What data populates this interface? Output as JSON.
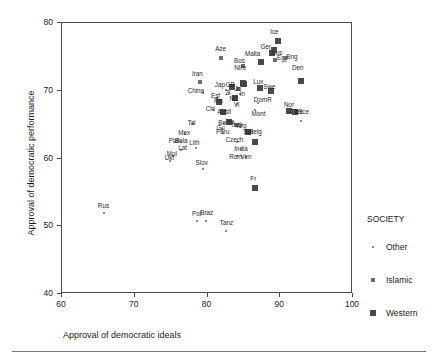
{
  "chart_data": {
    "type": "scatter",
    "title": "",
    "xlabel": "Approval of democratic ideals",
    "ylabel": "Approval of democratic performance",
    "xlim": [
      60,
      100
    ],
    "ylim": [
      40,
      80
    ],
    "xticks": [
      60,
      70,
      80,
      90,
      100
    ],
    "yticks": [
      40,
      50,
      60,
      70,
      80
    ],
    "grid": false,
    "legend": {
      "title": "SOCIETY",
      "position": "right",
      "entries": [
        {
          "label": "Other",
          "marker": "small-dot",
          "color": "#8a8a8a"
        },
        {
          "label": "Islamic",
          "marker": "medium-square",
          "color": "#6e6e6e"
        },
        {
          "label": "Western",
          "marker": "large-square",
          "color": "#4a4a4a"
        }
      ]
    },
    "points": [
      {
        "label": "Ice",
        "x": 89.7,
        "y": 77.4,
        "group": "Western",
        "lx": 89.2,
        "ly": 78.6
      },
      {
        "label": "Ger",
        "x": 89.1,
        "y": 76.0,
        "group": "Western",
        "lx": 88.0,
        "ly": 76.5
      },
      {
        "label": "Aus",
        "x": 88.8,
        "y": 75.5,
        "group": "Western",
        "lx": 89.5,
        "ly": 75.5
      },
      {
        "label": "Malta",
        "x": 87.3,
        "y": 74.3,
        "group": "Western",
        "lx": 86.2,
        "ly": 75.4
      },
      {
        "label": "Egy",
        "x": 89.3,
        "y": 74.5,
        "group": "Islamic",
        "lx": 90.3,
        "ly": 74.8
      },
      {
        "label": "Bng",
        "x": 90.6,
        "y": 74.8,
        "group": "Islamic",
        "lx": 91.6,
        "ly": 75.0
      },
      {
        "label": "Aze",
        "x": 81.9,
        "y": 74.9,
        "group": "Islamic",
        "lx": 81.8,
        "ly": 76.2
      },
      {
        "label": "Bos",
        "x": 84.9,
        "y": 73.6,
        "group": "Islamic",
        "lx": 84.4,
        "ly": 74.4
      },
      {
        "label": "NIre",
        "x": 85.0,
        "y": 71.0,
        "group": "Western",
        "lx": 84.5,
        "ly": 73.4
      },
      {
        "label": "Den",
        "x": 92.8,
        "y": 71.5,
        "group": "Western",
        "lx": 92.4,
        "ly": 73.4
      },
      {
        "label": "Iran",
        "x": 79.0,
        "y": 71.3,
        "group": "Islamic",
        "lx": 78.6,
        "ly": 72.5
      },
      {
        "label": "Lux",
        "x": 87.2,
        "y": 70.4,
        "group": "Western",
        "lx": 87.0,
        "ly": 71.3
      },
      {
        "label": "Swe",
        "x": 88.7,
        "y": 69.9,
        "group": "Western",
        "lx": 88.5,
        "ly": 70.6
      },
      {
        "label": "Jap",
        "x": 82.5,
        "y": 70.1,
        "group": "Other",
        "lx": 81.7,
        "ly": 70.8
      },
      {
        "label": "GB",
        "x": 83.4,
        "y": 70.5,
        "group": "Western",
        "lx": 83.1,
        "ly": 70.8
      },
      {
        "label": "Jo",
        "x": 84.2,
        "y": 70.2,
        "group": "Islamic",
        "lx": 84.2,
        "ly": 70.2
      },
      {
        "label": "Li",
        "x": 84.9,
        "y": 71.1,
        "group": "Western",
        "lx": 84.8,
        "ly": 70.9
      },
      {
        "label": "China",
        "x": 79.4,
        "y": 69.7,
        "group": "Other",
        "lx": 78.4,
        "ly": 69.9
      },
      {
        "label": "Zi",
        "x": 83.0,
        "y": 69.6,
        "group": "Other",
        "lx": 82.8,
        "ly": 69.6
      },
      {
        "label": "In",
        "x": 84.5,
        "y": 69.5,
        "group": "Other",
        "lx": 84.8,
        "ly": 69.5
      },
      {
        "label": "Esf",
        "x": 81.3,
        "y": 69.0,
        "group": "Other",
        "lx": 81.1,
        "ly": 69.2
      },
      {
        "label": "Fin",
        "x": 81.6,
        "y": 68.4,
        "group": "Western",
        "lx": 81.5,
        "ly": 68.5
      },
      {
        "label": "NZ",
        "x": 83.8,
        "y": 68.9,
        "group": "Western",
        "lx": 83.6,
        "ly": 68.8
      },
      {
        "label": "DomR",
        "x": 86.9,
        "y": 68.2,
        "group": "Other",
        "lx": 87.6,
        "ly": 68.7
      },
      {
        "label": "Vi",
        "x": 84.1,
        "y": 68.0,
        "group": "Other",
        "lx": 84.0,
        "ly": 67.9
      },
      {
        "label": "Chi",
        "x": 80.7,
        "y": 67.2,
        "group": "Other",
        "lx": 80.4,
        "ly": 67.3
      },
      {
        "label": "Austl",
        "x": 82.1,
        "y": 66.9,
        "group": "Western",
        "lx": 82.3,
        "ly": 66.8
      },
      {
        "label": "Mont",
        "x": 86.5,
        "y": 67.2,
        "group": "Other",
        "lx": 87.0,
        "ly": 66.5
      },
      {
        "label": "Nor",
        "x": 91.2,
        "y": 67.0,
        "group": "Western",
        "lx": 91.2,
        "ly": 67.9
      },
      {
        "label": "Gre",
        "x": 92.0,
        "y": 66.9,
        "group": "Western",
        "lx": 92.4,
        "ly": 66.9
      },
      {
        "label": "Alb",
        "x": 91.7,
        "y": 66.9,
        "group": "Islamic",
        "lx": 91.9,
        "ly": 66.9
      },
      {
        "label": "Sce",
        "x": 92.9,
        "y": 65.5,
        "group": "Other",
        "lx": 93.2,
        "ly": 66.9
      },
      {
        "label": "Tal",
        "x": 78.0,
        "y": 65.1,
        "group": "Other",
        "lx": 77.8,
        "ly": 65.3
      },
      {
        "label": "Bol",
        "x": 82.3,
        "y": 65.3,
        "group": "Other",
        "lx": 82.1,
        "ly": 65.2
      },
      {
        "label": "Ire",
        "x": 83.0,
        "y": 65.4,
        "group": "Western",
        "lx": 83.2,
        "ly": 65.4
      },
      {
        "label": "Turk",
        "x": 83.9,
        "y": 64.9,
        "group": "Islamic",
        "lx": 84.0,
        "ly": 64.9
      },
      {
        "label": "Arg",
        "x": 84.5,
        "y": 64.6,
        "group": "Other",
        "lx": 84.7,
        "ly": 64.8
      },
      {
        "label": "Gu",
        "x": 82.0,
        "y": 64.3,
        "group": "Other",
        "lx": 81.8,
        "ly": 64.5
      },
      {
        "label": "Peru",
        "x": 82.1,
        "y": 63.8,
        "group": "Other",
        "lx": 82.1,
        "ly": 63.9
      },
      {
        "label": "Mex",
        "x": 76.9,
        "y": 63.6,
        "group": "Other",
        "lx": 76.8,
        "ly": 63.7
      },
      {
        "label": "Swi",
        "x": 85.6,
        "y": 63.9,
        "group": "Western",
        "lx": 85.6,
        "ly": 63.9
      },
      {
        "label": "Belg",
        "x": 86.5,
        "y": 62.5,
        "group": "Western",
        "lx": 86.6,
        "ly": 63.9
      },
      {
        "label": "Czech",
        "x": 84.0,
        "y": 62.5,
        "group": "Other",
        "lx": 83.7,
        "ly": 62.7
      },
      {
        "label": "Phil",
        "x": 75.5,
        "y": 62.4,
        "group": "Other",
        "lx": 75.4,
        "ly": 62.6
      },
      {
        "label": "Bela",
        "x": 76.4,
        "y": 62.4,
        "group": "Other",
        "lx": 76.4,
        "ly": 62.6
      },
      {
        "label": "Lith",
        "x": 78.4,
        "y": 61.6,
        "group": "Other",
        "lx": 78.2,
        "ly": 62.3
      },
      {
        "label": "Lat",
        "x": 76.4,
        "y": 61.2,
        "group": "Other",
        "lx": 76.6,
        "ly": 61.6
      },
      {
        "label": "India",
        "x": 84.6,
        "y": 61.4,
        "group": "Other",
        "lx": 84.6,
        "ly": 61.4
      },
      {
        "label": "Mol",
        "x": 75.2,
        "y": 60.3,
        "group": "Other",
        "lx": 75.1,
        "ly": 60.6
      },
      {
        "label": "Ukr",
        "x": 74.9,
        "y": 59.6,
        "group": "Other",
        "lx": 74.8,
        "ly": 60.1
      },
      {
        "label": "Rom",
        "x": 84.0,
        "y": 60.3,
        "group": "Other",
        "lx": 83.9,
        "ly": 60.2
      },
      {
        "label": "Ven",
        "x": 85.3,
        "y": 60.2,
        "group": "Other",
        "lx": 85.3,
        "ly": 60.2
      },
      {
        "label": "Slov",
        "x": 79.4,
        "y": 58.5,
        "group": "Other",
        "lx": 79.2,
        "ly": 59.3
      },
      {
        "label": "Fr",
        "x": 86.5,
        "y": 55.7,
        "group": "Western",
        "lx": 86.3,
        "ly": 57.0
      },
      {
        "label": "Rus",
        "x": 65.8,
        "y": 51.9,
        "group": "Other",
        "lx": 65.7,
        "ly": 53.0
      },
      {
        "label": "Pol",
        "x": 78.6,
        "y": 50.8,
        "group": "Other",
        "lx": 78.5,
        "ly": 51.8
      },
      {
        "label": "Braz",
        "x": 79.8,
        "y": 50.8,
        "group": "Other",
        "lx": 79.9,
        "ly": 52.0
      },
      {
        "label": "Tanz",
        "x": 82.6,
        "y": 49.3,
        "group": "Other",
        "lx": 82.6,
        "ly": 50.5
      }
    ]
  }
}
